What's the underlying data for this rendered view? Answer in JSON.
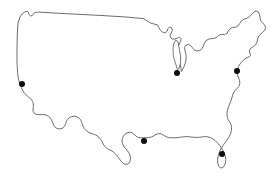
{
  "figure": {
    "kind": "map",
    "title": "",
    "width": 278,
    "height": 178,
    "background_color": "#ffffff"
  },
  "map": {
    "region_name": "Contiguous United States",
    "projection_style": "outline-silhouette",
    "outline": {
      "stroke_color": "#5a5a5a",
      "stroke_width": 0.9,
      "fill_color": "#ffffff",
      "path": "M 17.5 29.5 L 18.2 22.0 L 20.0 17.0 L 22.5 13.5 L 25.0 11.8 L 27.0 11.2 L 28.2 12.2 L 29.0 14.6 L 30.6 16.0 L 32.4 15.4 L 33.6 13.6 L 35.4 12.5 L 38.6 12.1 L 52.0 12.9 L 74.0 14.1 L 100.0 15.4 L 126.0 17.0 L 143.5 18.6 L 148.0 21.5 L 151.0 23.2 L 154.0 24.0 L 157.5 25.0 L 159.0 27.8 L 160.4 30.4 L 162.6 32.0 L 165.2 33.0 L 167.0 31.4 L 168.0 28.6 L 169.6 27.0 L 171.6 27.8 L 172.4 30.2 L 171.4 33.0 L 170.0 35.2 L 170.6 37.6 L 172.4 39.0 L 175.0 39.0 L 177.6 38.0 L 179.6 37.4 L 181.0 38.8 L 180.6 41.4 L 179.2 44.0 L 178.0 47.0 L 177.4 50.6 L 177.6 55.0 L 178.6 59.6 L 180.0 64.0 L 181.0 68.2 L 181.2 71.4 L 182.4 70.0 L 184.0 66.6 L 185.4 62.8 L 186.2 58.6 L 186.0 54.6 L 185.0 50.8 L 184.6 47.4 L 186.0 45.2 L 188.4 44.4 L 190.6 45.6 L 192.4 47.6 L 194.0 49.8 L 196.6 51.0 L 199.6 50.6 L 202.0 48.6 L 203.4 46.0 L 204.4 43.0 L 206.0 40.6 L 208.6 39.2 L 211.6 38.6 L 214.6 38.2 L 217.0 37.0 L 219.0 35.2 L 221.6 34.4 L 224.6 34.6 L 227.0 33.4 L 228.4 31.0 L 230.0 28.6 L 232.6 27.4 L 235.6 27.2 L 238.0 26.0 L 239.6 23.6 L 241.4 21.0 L 244.0 19.2 L 247.0 18.2 L 249.6 16.6 L 251.6 14.4 L 253.6 12.2 L 256.0 11.0 L 258.4 12.0 L 259.6 14.6 L 260.0 17.6 L 260.6 20.6 L 262.4 22.8 L 264.6 24.8 L 265.6 27.6 L 264.6 30.4 L 262.6 32.4 L 260.4 34.2 L 258.6 36.4 L 257.6 39.2 L 257.0 42.2 L 255.6 44.8 L 253.4 46.6 L 251.0 48.0 L 249.4 50.2 L 249.8 53.0 L 250.6 55.4 L 249.0 57.0 L 246.4 58.0 L 244.0 59.6 L 242.0 61.6 L 240.2 63.8 L 238.6 66.2 L 237.4 69.0 L 236.8 72.0 L 237.4 75.0 L 238.6 77.8 L 239.6 80.6 L 239.8 83.6 L 238.8 86.4 L 237.0 88.6 L 235.0 90.6 L 233.4 93.0 L 232.4 95.8 L 231.6 98.8 L 230.6 101.8 L 229.4 104.6 L 228.2 107.6 L 227.4 110.6 L 227.0 113.6 L 227.2 116.6 L 228.0 119.4 L 229.6 121.8 L 231.0 124.4 L 231.6 127.4 L 231.4 130.6 L 230.6 133.8 L 229.2 136.8 L 227.4 139.6 L 225.4 142.2 L 223.4 144.8 L 221.6 147.6 L 220.0 150.6 L 218.8 153.8 L 218.0 157.0 L 217.6 160.2 L 217.8 163.4 L 218.8 166.2 L 220.6 168.0 L 222.8 167.6 L 224.4 165.6 L 225.4 162.8 L 225.8 159.6 L 225.4 156.4 L 224.4 153.4 L 223.0 150.6 L 221.4 148.0 L 219.6 145.4 L 217.6 143.0 L 215.4 140.8 L 213.0 139.0 L 210.4 137.6 L 207.6 136.8 L 204.6 136.6 L 201.6 137.0 L 198.6 137.4 L 195.6 137.4 L 192.6 137.2 L 189.6 136.8 L 186.6 136.6 L 183.6 136.8 L 180.6 137.2 L 177.6 137.6 L 174.6 137.8 L 171.6 137.8 L 168.6 137.6 L 166.0 136.6 L 163.6 135.2 L 161.2 134.0 L 158.6 133.6 L 156.0 134.4 L 153.8 135.8 L 151.4 137.0 L 148.8 137.6 L 146.0 137.8 L 143.2 137.8 L 140.4 137.8 L 137.8 137.2 L 135.6 135.8 L 133.8 134.0 L 131.8 132.6 L 129.4 132.2 L 127.0 132.8 L 125.0 134.2 L 123.4 136.0 L 122.4 138.4 L 122.0 141.0 L 122.4 143.6 L 123.6 146.0 L 125.2 148.2 L 127.0 150.2 L 128.6 152.4 L 129.8 154.8 L 130.4 157.4 L 130.4 160.0 L 129.6 162.4 L 128.0 164.0 L 125.8 164.4 L 123.6 163.6 L 121.8 162.0 L 120.2 160.0 L 118.6 157.8 L 117.0 155.6 L 115.2 153.6 L 113.2 151.8 L 111.0 150.4 L 108.6 149.4 L 106.4 148.0 L 104.6 146.2 L 103.2 144.0 L 102.0 141.6 L 100.6 139.4 L 99.0 137.4 L 97.0 135.8 L 94.8 134.6 L 92.4 133.8 L 90.0 133.0 L 87.8 131.8 L 85.8 130.2 L 84.2 128.4 L 83.0 126.2 L 82.2 123.8 L 81.4 121.4 L 80.2 119.2 L 78.4 117.6 L 76.2 116.6 L 74.0 116.2 L 71.6 116.6 L 69.4 117.6 L 67.6 119.2 L 66.4 121.4 L 65.6 123.8 L 64.6 126.0 L 63.0 127.8 L 60.8 128.8 L 58.4 128.8 L 56.2 128.0 L 54.4 126.4 L 53.2 124.2 L 52.4 121.8 L 51.4 119.6 L 50.0 117.6 L 48.2 116.0 L 46.0 115.0 L 43.6 114.6 L 41.2 114.6 L 38.8 114.6 L 36.4 114.4 L 34.4 113.4 L 33.2 111.4 L 33.0 109.0 L 33.4 106.4 L 33.4 103.8 L 32.6 101.4 L 31.2 99.4 L 29.4 97.8 L 27.4 96.2 L 25.6 94.4 L 24.0 92.4 L 22.6 90.2 L 21.4 87.8 L 20.4 85.2 L 19.4 82.4 L 18.6 79.4 L 18.0 76.2 L 17.6 72.8 L 17.4 69.2 L 17.2 65.4 L 17.0 61.4 L 17.0 57.2 L 17.0 52.8 L 17.0 48.2 L 17.1 43.4 L 17.2 38.4 L 17.5 29.5 Z",
      "path_note": "single continuous silhouette of the lower-48 landmass including Puget Sound notch, Great Lakes border, Maine peak, Atlantic coast, Florida peninsula, Gulf coast, Texas tip, and Pacific coast"
    },
    "interior_outlines": [
      {
        "name": "lake-michigan",
        "path": "M 175.4 40.4 L 174.0 43.2 L 173.2 46.6 L 173.0 50.4 L 173.2 54.4 L 174.0 58.4 L 175.2 62.4 L 176.4 66.2 L 177.4 69.6 L 179.0 68.6 L 180.0 65.2 L 180.6 61.2 L 180.6 57.0 L 180.0 52.8 L 179.2 48.8 L 178.6 45.0 L 178.0 41.8 Z"
      }
    ],
    "markers": [
      {
        "id": "marker-west-coast",
        "label": "",
        "x": 22,
        "y": 84,
        "r": 3.0,
        "color": "#0d0d0d"
      },
      {
        "id": "marker-great-lakes",
        "label": "",
        "x": 177,
        "y": 73,
        "r": 3.0,
        "color": "#0d0d0d"
      },
      {
        "id": "marker-northeast",
        "label": "",
        "x": 237,
        "y": 71,
        "r": 3.0,
        "color": "#0d0d0d"
      },
      {
        "id": "marker-south-central",
        "label": "",
        "x": 144,
        "y": 141,
        "r": 3.0,
        "color": "#0d0d0d"
      },
      {
        "id": "marker-southeast",
        "label": "",
        "x": 222,
        "y": 154,
        "r": 3.0,
        "color": "#0d0d0d"
      }
    ],
    "marker_count": 5,
    "labels": [],
    "legend": null
  }
}
